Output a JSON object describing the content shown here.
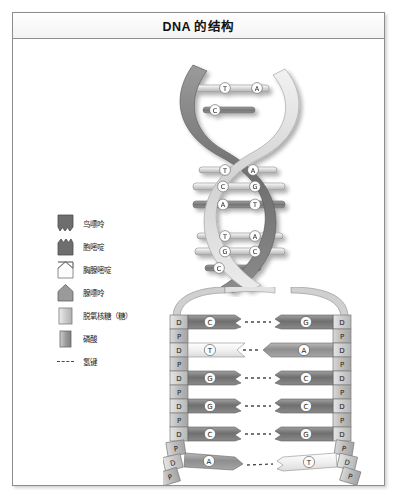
{
  "figure": {
    "title": "DNA 的结构"
  },
  "legend": {
    "items": [
      {
        "label": "鸟嘌呤",
        "icon": "guanine-swatch",
        "shape": "notch-zigzag",
        "fill": "#6e6e6e"
      },
      {
        "label": "胞嘧啶",
        "icon": "cytosine-swatch",
        "shape": "notch-zigzag",
        "fill": "#6e6e6e"
      },
      {
        "label": "胸腺嘧啶",
        "icon": "thymine-swatch",
        "shape": "notch-chevron",
        "fill": "#fdfdfd"
      },
      {
        "label": "腺嘌呤",
        "icon": "adenine-swatch",
        "shape": "point-up",
        "fill": "#9a9a9a"
      },
      {
        "label": "脱氧核糖（糖）",
        "icon": "deoxyribose-swatch",
        "shape": "rect",
        "fill": "#c9c9c9"
      },
      {
        "label": "磷酸",
        "icon": "phosphate-swatch",
        "shape": "rect",
        "fill": "#8f8f8f"
      },
      {
        "label": "氢键",
        "icon": "hydrogen-bond-swatch",
        "shape": "dashed-line",
        "fill": "#4a4a4a"
      }
    ]
  },
  "helix": {
    "description": "DNA 双螺旋",
    "base_pairs": [
      {
        "left": "T",
        "right": "A"
      },
      {
        "left": "C",
        "right": ""
      },
      {
        "left": "T",
        "right": "A"
      },
      {
        "left": "C",
        "right": "G"
      },
      {
        "left": "A",
        "right": "T"
      },
      {
        "left": "T",
        "right": "A"
      },
      {
        "left": "G",
        "right": "C"
      },
      {
        "left": "C",
        "right": ""
      }
    ]
  },
  "ladder": {
    "backbone_left": [
      "D",
      "P",
      "D",
      "P",
      "D",
      "P",
      "D",
      "P",
      "D",
      "P",
      "D",
      "P"
    ],
    "backbone_right": [
      "D",
      "P",
      "D",
      "P",
      "D",
      "P",
      "D",
      "P",
      "D",
      "P",
      "D",
      "P"
    ],
    "rows": [
      {
        "left_base": "C",
        "right_base": "G",
        "bond": "氢键"
      },
      {
        "left_base": "T",
        "right_base": "A",
        "bond": "氢键"
      },
      {
        "left_base": "G",
        "right_base": "C",
        "bond": "氢键"
      },
      {
        "left_base": "G",
        "right_base": "C",
        "bond": "氢键"
      },
      {
        "left_base": "C",
        "right_base": "G",
        "bond": "氢键"
      },
      {
        "left_base": "A",
        "right_base": "T",
        "bond": "氢键"
      }
    ],
    "sugar_label": "D",
    "phosphate_label": "P"
  },
  "colors": {
    "frame_border": "#8d8d8d",
    "base_dark": "#6e6e6e",
    "base_light": "#fbfbfb",
    "base_mid": "#9a9a9a",
    "sugar": "#c9c9c9",
    "phosphate": "#b4b4b4",
    "strand_dark": "#808080",
    "strand_light": "#d6d6d6",
    "text": "#1c1c1c"
  }
}
